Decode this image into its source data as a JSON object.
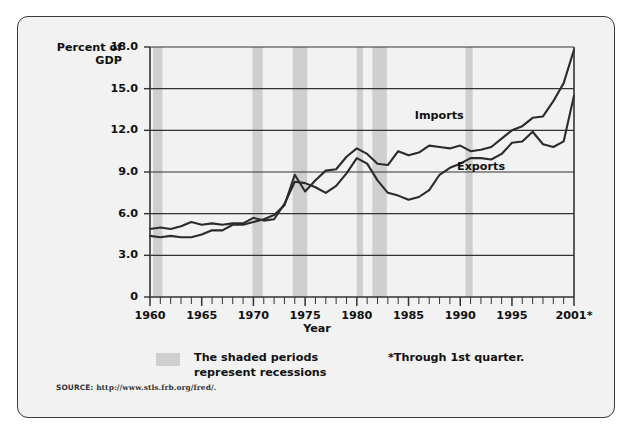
{
  "figure": {
    "y_axis_title_line1": "Percent of",
    "y_axis_title_line2": "GDP",
    "x_axis_title": "Year",
    "imports_label": "Imports",
    "exports_label": "Exports",
    "legend_text_line1": "The shaded periods",
    "legend_text_line2": "represent recessions",
    "footnote": "*Through 1st quarter.",
    "source_prefix": "SOURCE:",
    "source_url": "http://www.stls.frb.org/fred/.",
    "colors": {
      "panel_background": "#f2f2f2",
      "frame_border": "#3a3a3a",
      "line": "#2b2b2b",
      "gridline": "#333333",
      "recession_band": "#cfcfcf",
      "text": "#111111"
    }
  },
  "chart_data": {
    "type": "line",
    "title": "",
    "xlabel": "Year",
    "ylabel": "Percent of GDP",
    "xlim": [
      1960,
      2001
    ],
    "ylim": [
      0,
      18
    ],
    "yticks": [
      0,
      3.0,
      6.0,
      9.0,
      12.0,
      15.0,
      18.0
    ],
    "ytick_labels": [
      "0",
      "3.0",
      "6.0",
      "9.0",
      "12.0",
      "15.0",
      "18.0"
    ],
    "xticks": [
      1960,
      1965,
      1970,
      1975,
      1980,
      1985,
      1990,
      1995,
      2001
    ],
    "xtick_labels": [
      "1960",
      "1965",
      "1970",
      "1975",
      "1980",
      "1985",
      "1990",
      "1995",
      "2001*"
    ],
    "minor_xtick_interval": 1,
    "grid": "horizontal",
    "legend_position": "inline-annotations",
    "x": [
      1960,
      1961,
      1962,
      1963,
      1964,
      1965,
      1966,
      1967,
      1968,
      1969,
      1970,
      1971,
      1972,
      1973,
      1974,
      1975,
      1976,
      1977,
      1978,
      1979,
      1980,
      1981,
      1982,
      1983,
      1984,
      1985,
      1986,
      1987,
      1988,
      1989,
      1990,
      1991,
      1992,
      1993,
      1994,
      1995,
      1996,
      1997,
      1998,
      1999,
      2000,
      2001
    ],
    "series": [
      {
        "name": "Exports",
        "values": [
          4.9,
          5.0,
          4.9,
          5.1,
          5.4,
          5.2,
          5.3,
          5.2,
          5.3,
          5.3,
          5.7,
          5.5,
          5.6,
          6.7,
          8.3,
          8.2,
          7.9,
          7.5,
          8.0,
          8.9,
          10.0,
          9.6,
          8.4,
          7.5,
          7.3,
          7.0,
          7.2,
          7.7,
          8.8,
          9.3,
          9.6,
          10.0,
          10.0,
          9.9,
          10.3,
          11.1,
          11.2,
          11.9,
          11.0,
          10.8,
          11.2,
          14.5
        ],
        "color": "#2b2b2b",
        "label_at": {
          "x": 1992.2,
          "y": 9.35
        }
      },
      {
        "name": "Imports",
        "values": [
          4.4,
          4.3,
          4.4,
          4.3,
          4.3,
          4.5,
          4.8,
          4.8,
          5.2,
          5.2,
          5.4,
          5.6,
          5.9,
          6.6,
          8.8,
          7.6,
          8.4,
          9.1,
          9.2,
          10.1,
          10.7,
          10.3,
          9.6,
          9.5,
          10.5,
          10.2,
          10.4,
          10.9,
          10.8,
          10.7,
          10.9,
          10.5,
          10.6,
          10.8,
          11.4,
          12.0,
          12.3,
          12.9,
          13.0,
          14.1,
          15.4,
          17.8
        ],
        "color": "#2b2b2b",
        "label_at": {
          "x": 1988.5,
          "y": 13.0
        }
      }
    ],
    "recession_bands": [
      {
        "start": 1960.3,
        "end": 1961.2
      },
      {
        "start": 1969.9,
        "end": 1970.9
      },
      {
        "start": 1973.8,
        "end": 1975.2
      },
      {
        "start": 1980.0,
        "end": 1980.6
      },
      {
        "start": 1981.5,
        "end": 1982.9
      },
      {
        "start": 1990.5,
        "end": 1991.2
      }
    ],
    "annotations": [
      "The shaded periods represent recessions",
      "*Through 1st quarter."
    ]
  }
}
